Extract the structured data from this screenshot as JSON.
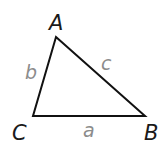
{
  "diagram": {
    "type": "triangle",
    "vertices": [
      {
        "name": "A",
        "x": 56,
        "y": 37
      },
      {
        "name": "B",
        "x": 145,
        "y": 116
      },
      {
        "name": "C",
        "x": 33,
        "y": 116
      }
    ],
    "vertex_labels": {
      "A": "A",
      "B": "B",
      "C": "C"
    },
    "side_labels": {
      "a": "a",
      "b": "b",
      "c": "c"
    },
    "colors": {
      "edge": "#111111",
      "vertex_label": "#1a1a1a",
      "side_label": "#8c8c8c"
    }
  }
}
